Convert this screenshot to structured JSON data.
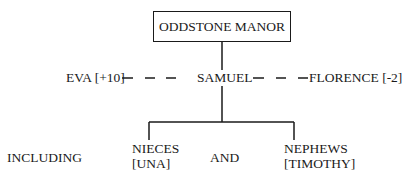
{
  "diagram": {
    "root": {
      "label": "ODDSTONE MANOR"
    },
    "center": {
      "label": "SAMUEL"
    },
    "left_partner": {
      "label": "EVA [+10]"
    },
    "right_partner": {
      "label": "FLORENCE [-2]"
    },
    "children_prefix": "INCLUDING",
    "children": [
      {
        "line1": "NIECES",
        "line2": "[UNA]"
      },
      {
        "line1": "NEPHEWS",
        "line2": "[TIMOTHY]"
      }
    ],
    "conjunction": "AND"
  }
}
